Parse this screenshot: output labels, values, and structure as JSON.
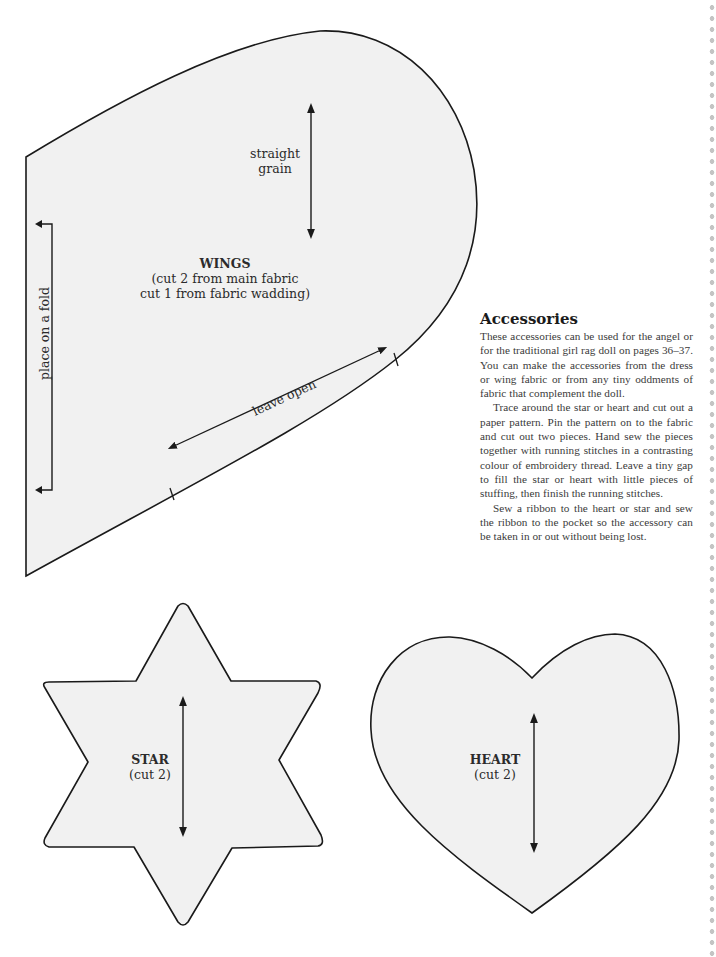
{
  "wings": {
    "title": "WINGS",
    "instructions_line1": "(cut 2 from main fabric",
    "instructions_line2": "cut 1 from fabric wadding)",
    "grain_line1": "straight",
    "grain_line2": "grain",
    "fold_label": "place on a fold",
    "open_label": "leave open"
  },
  "star": {
    "title": "STAR",
    "instructions": "(cut 2)"
  },
  "heart": {
    "title": "HEART",
    "instructions": "(cut 2)"
  },
  "article": {
    "heading": "Accessories",
    "paragraphs": [
      "These accessories can be used for the angel or for the traditional girl rag doll on pages 36–37. You can make the accessories from the dress or wing fabric or from any tiny oddments of fabric that complement the doll.",
      "Trace around the star or heart and cut out a paper pattern. Pin the pattern on to the fabric and cut out two pieces. Hand sew the pieces together with running stitches in a contrasting colour of embroidery thread. Leave a tiny gap to fill the star or heart with little pieces of stuffing, then finish the running stitches.",
      "Sew a ribbon to the heart or star and sew the ribbon to the pocket so the accessory can be taken in or out without being lost."
    ]
  },
  "colors": {
    "pattern_fill": "#f1f1f1",
    "outline": "#1a1a1a",
    "border_dots": "#c4c4c4"
  }
}
